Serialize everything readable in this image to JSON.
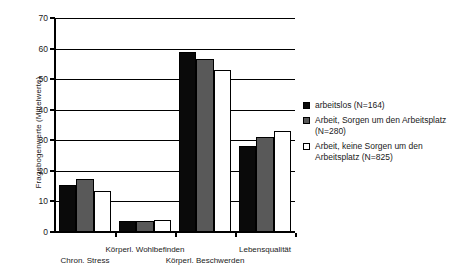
{
  "chart_data": {
    "type": "bar",
    "title": "",
    "xlabel": "",
    "ylabel": "Fragebogenwerte (Mittelwerte)",
    "ylim": [
      0,
      70
    ],
    "yticks": [
      0,
      10,
      20,
      30,
      40,
      50,
      60,
      70
    ],
    "grid": true,
    "legend_position": "right",
    "categories": [
      "Chron. Stress",
      "Körperl. Wohlbefinden",
      "Körperl. Beschwerden",
      "Lebensqualität"
    ],
    "series": [
      {
        "name": "arbeitslos (N=164)",
        "color": "#0a0a0a",
        "values": [
          15.5,
          3.5,
          59.0,
          28.0
        ]
      },
      {
        "name": "Arbeit, Sorgen um den Arbeitsplatz (N=280)",
        "color": "#595959",
        "values": [
          17.5,
          3.7,
          56.5,
          31.0
        ]
      },
      {
        "name": "Arbeit, keine Sorgen um den Arbeitsplatz (N=825)",
        "color": "#ffffff",
        "values": [
          13.5,
          4.0,
          53.0,
          33.0
        ]
      }
    ]
  },
  "axis": {
    "y_tick_labels": [
      "0",
      "10",
      "20",
      "30",
      "40",
      "50",
      "60",
      "70"
    ],
    "y_title": "Fragebogenwerte (Mittelwerte)"
  },
  "x_labels": [
    {
      "text": "Chron. Stress",
      "row": "b"
    },
    {
      "text": "Körperl. Wohlbefinden",
      "row": "a"
    },
    {
      "text": "Körperl. Beschwerden",
      "row": "b"
    },
    {
      "text": "Lebensqualität",
      "row": "a"
    }
  ],
  "legend": {
    "items": [
      {
        "label": "arbeitslos (N=164)",
        "swatch": "black-square-swatch"
      },
      {
        "label": "Arbeit, Sorgen um den Arbeitsplatz (N=280)",
        "swatch": "gray-square-swatch"
      },
      {
        "label": "Arbeit, keine Sorgen um den Arbeitsplatz (N=825)",
        "swatch": "white-square-swatch"
      }
    ]
  },
  "colors": {
    "series_1": "#0a0a0a",
    "series_2": "#595959",
    "series_3": "#ffffff",
    "axis": "#000000",
    "background": "#ffffff"
  }
}
